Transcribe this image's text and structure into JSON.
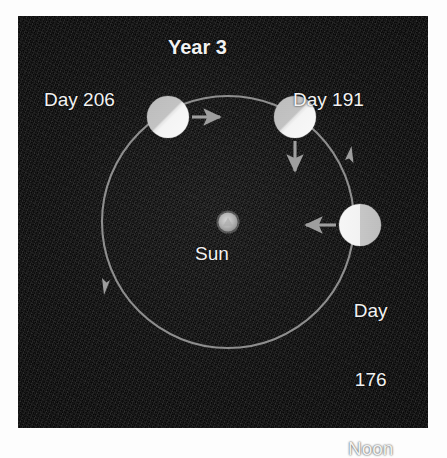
{
  "figure": {
    "title": "Year 3",
    "type": "orbital-diagram",
    "background_color": "#0d0d0d",
    "text_color": "#f2f2f2",
    "orbit_color": "#9a9a9a",
    "sun_color": "#b9b9b9",
    "planet_light_color": "#f4f4f4",
    "planet_dark_color": "#b6b6b6"
  },
  "center_body": {
    "label": "Sun",
    "cx": 210,
    "cy": 206,
    "r": 10
  },
  "orbit": {
    "cx": 210,
    "cy": 206,
    "r": 126,
    "direction": "counterclockwise",
    "direction_markers": 2
  },
  "positions": [
    {
      "id": "day-176",
      "label": "Day\n176\nNoon",
      "label_lines": [
        "Day",
        "176",
        "Noon"
      ],
      "angle_deg": 0,
      "cx": 342,
      "cy": 209,
      "r": 21,
      "terminator": "vertical",
      "lit_side": "left",
      "arrow": "left",
      "arrow_meaning": "toward-sun"
    },
    {
      "id": "day-191",
      "label": "Day 191",
      "angle_deg": 57,
      "cx": 277,
      "cy": 101,
      "r": 21,
      "terminator": "diagonal",
      "lit_side": "lower-right",
      "arrow": "down",
      "arrow_meaning": "toward-sun"
    },
    {
      "id": "day-206",
      "label": "Day 206",
      "angle_deg": 123,
      "cx": 150,
      "cy": 101,
      "r": 21,
      "terminator": "diagonal",
      "lit_side": "lower-right",
      "arrow": "right",
      "arrow_meaning": "toward-sun"
    }
  ]
}
